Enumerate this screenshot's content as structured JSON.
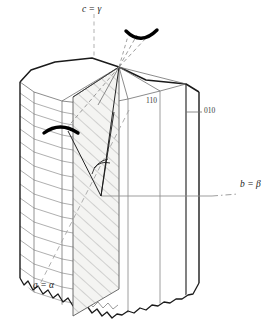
{
  "figure": {
    "type": "crystallographic-diagram"
  },
  "axes": [
    {
      "id": "c-axis",
      "label_crystal": "c",
      "label_optical": "γ",
      "equals": "=",
      "text": "c = γ",
      "position": "top",
      "line_style": "dashed",
      "color": "#9a9a9a"
    },
    {
      "id": "b-axis",
      "label_crystal": "b",
      "label_optical": "β",
      "equals": "=",
      "text": "b = β",
      "position": "right",
      "line_style": "dash-dot",
      "color": "#8c8c8c"
    },
    {
      "id": "a-axis",
      "label_crystal": "a",
      "label_optical": "α",
      "equals": "=",
      "text": "a = α",
      "position": "bottom-left",
      "line_style": "dashed",
      "color": "#9a9a9a"
    }
  ],
  "faces": [
    {
      "id": "face-110",
      "miller_index": "110",
      "label": "110"
    },
    {
      "id": "face-010",
      "miller_index": "010",
      "label": "010"
    }
  ],
  "annotations": {
    "upper_arc": "optic-axis-arc-upper",
    "left_arc": "optic-axis-arc-left",
    "angle_marker": "extinction-angle-arc",
    "section_plane": "hatched-section-plane",
    "striations": "horizontal-striations",
    "broken_base": "jagged-broken-termination"
  },
  "colors": {
    "outline": "#1a1a1a",
    "thin_line": "#7d7d7d",
    "striation": "#8a8a8a",
    "hatch": "#9a9a9a",
    "axis_dash": "#9a9a9a",
    "arc_bold": "#000000",
    "section_fill": "#f2f2f0",
    "background": "#ffffff"
  }
}
